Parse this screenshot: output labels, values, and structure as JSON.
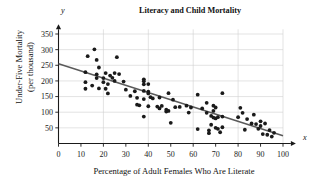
{
  "chart_data": {
    "type": "scatter",
    "title": "Literacy and Child Mortality",
    "xlabel": "Percentage of Adult Females Who Are Literate",
    "ylabel": "Under-Five Mortality (per thousand)",
    "ylabel_line1": "Under-Five Mortality",
    "ylabel_line2": "(per thousand)",
    "x_axis_symbol": "x",
    "y_axis_symbol": "y",
    "xlim": [
      0,
      100
    ],
    "ylim": [
      0,
      365
    ],
    "xticks": [
      0,
      10,
      20,
      30,
      40,
      50,
      60,
      70,
      80,
      90,
      100
    ],
    "ytick_labels": [
      50,
      100,
      150,
      200,
      250,
      300,
      350
    ],
    "grid": true,
    "grid_x_every": 20,
    "grid_y_every": 50,
    "legend": "none",
    "point_color": "#1a1a1a",
    "line_color": "#5a5a5a",
    "grid_color": "#d0d0d0",
    "axis_color": "#1a1a1a",
    "trendline": {
      "name": "least-squares regression line",
      "x": [
        0,
        100
      ],
      "y": [
        255,
        25
      ]
    },
    "series": [
      {
        "name": "countries",
        "points": [
          [
            12,
            228
          ],
          [
            12,
            196
          ],
          [
            12,
            175
          ],
          [
            13,
            279
          ],
          [
            15,
            185
          ],
          [
            16,
            301
          ],
          [
            17,
            267
          ],
          [
            17,
            221
          ],
          [
            17,
            209
          ],
          [
            18,
            243
          ],
          [
            18,
            176
          ],
          [
            20,
            209
          ],
          [
            20,
            196
          ],
          [
            21,
            225
          ],
          [
            21,
            175
          ],
          [
            22,
            190
          ],
          [
            22,
            160
          ],
          [
            23,
            217
          ],
          [
            24,
            210
          ],
          [
            25,
            225
          ],
          [
            25,
            200
          ],
          [
            26,
            276
          ],
          [
            27,
            222
          ],
          [
            29,
            198
          ],
          [
            30,
            172
          ],
          [
            32,
            152
          ],
          [
            34,
            167
          ],
          [
            35,
            146
          ],
          [
            35,
            124
          ],
          [
            36,
            122
          ],
          [
            38,
            205
          ],
          [
            38,
            199
          ],
          [
            38,
            189
          ],
          [
            38,
            168
          ],
          [
            38,
            142
          ],
          [
            38,
            86
          ],
          [
            40,
            190
          ],
          [
            40,
            166
          ],
          [
            40,
            160
          ],
          [
            40,
            119
          ],
          [
            41,
            148
          ],
          [
            42,
            144
          ],
          [
            44,
            118
          ],
          [
            45,
            147
          ],
          [
            45,
            112
          ],
          [
            46,
            120
          ],
          [
            48,
            108
          ],
          [
            48,
            102
          ],
          [
            49,
            161
          ],
          [
            49,
            104
          ],
          [
            50,
            66
          ],
          [
            51,
            140
          ],
          [
            52,
            116
          ],
          [
            54,
            117
          ],
          [
            57,
            121
          ],
          [
            58,
            99
          ],
          [
            59,
            115
          ],
          [
            62,
            156
          ],
          [
            62,
            46
          ],
          [
            64,
            112
          ],
          [
            66,
            130
          ],
          [
            66,
            98
          ],
          [
            67,
            33
          ],
          [
            67,
            42
          ],
          [
            68,
            88
          ],
          [
            68,
            60
          ],
          [
            69,
            121
          ],
          [
            69,
            104
          ],
          [
            69,
            83
          ],
          [
            70,
            115
          ],
          [
            70,
            80
          ],
          [
            70,
            50
          ],
          [
            71,
            84
          ],
          [
            71,
            47
          ],
          [
            72,
            36
          ],
          [
            73,
            161
          ],
          [
            73,
            86
          ],
          [
            73,
            52
          ],
          [
            80,
            84
          ],
          [
            81,
            114
          ],
          [
            82,
            98
          ],
          [
            83,
            44
          ],
          [
            84,
            78
          ],
          [
            86,
            64
          ],
          [
            87,
            92
          ],
          [
            88,
            62
          ],
          [
            89,
            47
          ],
          [
            90,
            71
          ],
          [
            90,
            56
          ],
          [
            91,
            30
          ],
          [
            92,
            64
          ],
          [
            93,
            28
          ],
          [
            94,
            43
          ],
          [
            95,
            22
          ],
          [
            96,
            34
          ]
        ]
      }
    ]
  }
}
